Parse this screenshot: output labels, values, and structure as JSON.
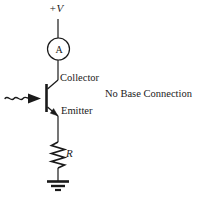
{
  "figure": {
    "type": "circuit-schematic",
    "background_color": "#ffffff",
    "line_color": "#1a1a1a"
  },
  "labels": {
    "supply": "+V",
    "meter": "A",
    "collector": "Collector",
    "emitter": "Emitter",
    "no_base_connection": "No Base Connection",
    "resistor": "R"
  },
  "components": [
    {
      "name": "supply-rail",
      "kind": "terminal",
      "label": "+V"
    },
    {
      "name": "ammeter",
      "kind": "meter",
      "label": "A",
      "shape": "circle"
    },
    {
      "name": "phototransistor",
      "kind": "npn-transistor",
      "terminals": [
        "Collector",
        "Emitter"
      ],
      "base": "No Base Connection"
    },
    {
      "name": "light-arrow",
      "kind": "incident-light",
      "shape": "wavy-arrow"
    },
    {
      "name": "resistor",
      "kind": "resistor",
      "label": "R",
      "shape": "zigzag"
    },
    {
      "name": "ground",
      "kind": "ground",
      "shape": "three-bar"
    }
  ]
}
